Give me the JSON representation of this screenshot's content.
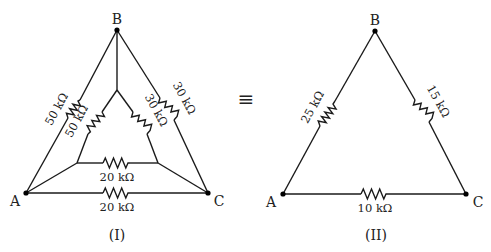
{
  "diagram": {
    "equivalence_symbol": "≡",
    "circuit_I": {
      "caption": "(I)",
      "nodes": {
        "A": "A",
        "B": "B",
        "C": "C"
      },
      "resistors": {
        "AB_outer": "50 kΩ",
        "AB_inner": "50 kΩ",
        "BC_outer": "30 kΩ",
        "BC_inner": "30 kΩ",
        "AC_inner": "20 kΩ",
        "AC_outer": "20 kΩ"
      }
    },
    "circuit_II": {
      "caption": "(II)",
      "nodes": {
        "A": "A",
        "B": "B",
        "C": "C"
      },
      "resistors": {
        "AB": "25 kΩ",
        "BC": "15 kΩ",
        "AC": "10 kΩ"
      }
    },
    "colors": {
      "line": "#1a1a1a",
      "text": "#222222",
      "background": "#ffffff"
    }
  }
}
